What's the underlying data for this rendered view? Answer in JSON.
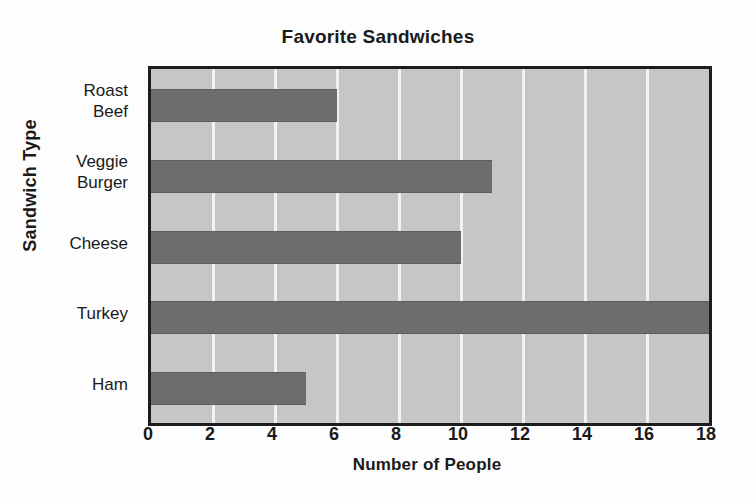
{
  "chart_data": {
    "type": "bar",
    "orientation": "horizontal",
    "title": "Favorite Sandwiches",
    "xlabel": "Number of People",
    "ylabel": "Sandwich Type",
    "categories": [
      "Roast Beef",
      "Veggie Burger",
      "Cheese",
      "Turkey",
      "Ham"
    ],
    "category_lines": [
      [
        "Roast",
        "Beef"
      ],
      [
        "Veggie",
        "Burger"
      ],
      [
        "Cheese"
      ],
      [
        "Turkey"
      ],
      [
        "Ham"
      ]
    ],
    "values": [
      6,
      11,
      10,
      18,
      5
    ],
    "xlim": [
      0,
      18
    ],
    "xticks": [
      0,
      2,
      4,
      6,
      8,
      10,
      12,
      14,
      16,
      18
    ],
    "xtick_labels": [
      "0",
      "2",
      "4",
      "6",
      "8",
      "10",
      "12",
      "14",
      "16",
      "18"
    ],
    "grid": "vertical-major",
    "legend": "none",
    "colors": {
      "bar": "#6d6d6d",
      "plot_background": "#c6c6c6",
      "gridline": "#f2f2f2",
      "axis_frame": "#1d1d1d",
      "text": "#1a1a1a",
      "figure_background": "#fdfdfd"
    }
  }
}
